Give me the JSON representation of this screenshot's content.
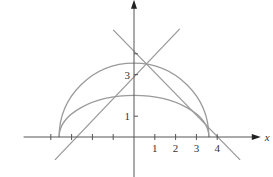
{
  "chart_data": {
    "type": "line",
    "title": "",
    "xlabel": "x",
    "ylabel": "y",
    "xlim": [
      -5.5,
      6
    ],
    "ylim": [
      -2,
      6.5
    ],
    "grid": false,
    "legend": null,
    "x_ticks": [
      -4,
      -3,
      -2,
      -1,
      1,
      2,
      3,
      4
    ],
    "x_tick_labels": [
      {
        "value": 1,
        "label": "1"
      },
      {
        "value": 2,
        "label": "2"
      },
      {
        "value": 3,
        "label": "3"
      },
      {
        "value": 4,
        "label": "4"
      }
    ],
    "y_ticks": [
      1,
      3,
      4
    ],
    "y_tick_labels": [
      {
        "value": 1,
        "label": "1"
      },
      {
        "value": 3,
        "label": "3"
      }
    ],
    "series": [
      {
        "name": "outer-semicircle",
        "kind": "upper-ellipse",
        "cx": 0,
        "cy": 0,
        "rx": 3.6,
        "ry": 3.55
      },
      {
        "name": "inner-semi-ellipse",
        "kind": "upper-ellipse",
        "cx": 0,
        "cy": 0,
        "rx": 3.6,
        "ry": 2.0
      },
      {
        "name": "rising-line",
        "kind": "segment",
        "x": [
          -3.8,
          2.2
        ],
        "y": [
          -1.1,
          5.2
        ]
      },
      {
        "name": "falling-line",
        "kind": "segment",
        "x": [
          -1.0,
          5.1
        ],
        "y": [
          5.15,
          -1.1
        ]
      }
    ],
    "colors": {
      "curves": "#9a9a9a",
      "axes": "#555555",
      "text": "#333333"
    }
  },
  "view": {
    "origin_px": [
      134,
      137
    ],
    "unit_px": 20.8
  }
}
